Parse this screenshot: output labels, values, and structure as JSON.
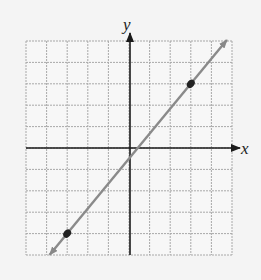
{
  "chart_data": {
    "type": "line",
    "title": "",
    "xlabel": "x",
    "ylabel": "y",
    "xlim": [
      -5,
      5
    ],
    "ylim": [
      -5,
      5
    ],
    "grid": true,
    "tick_labels": false,
    "series": [
      {
        "name": "line",
        "equation": "y = (7/6)x - 1/2",
        "slope": 1.1667,
        "y_intercept": -0.5,
        "points": [
          {
            "x": -3,
            "y": -4
          },
          {
            "x": 3,
            "y": 3
          }
        ],
        "arrows_both_ends": true,
        "color": "#888888"
      }
    ],
    "point_color": "#222222",
    "axis_color": "#1a1a1a",
    "grid_color": "#a8a8a8",
    "background": "#f4f4f4"
  },
  "labels": {
    "x_axis": "x",
    "y_axis": "y"
  }
}
